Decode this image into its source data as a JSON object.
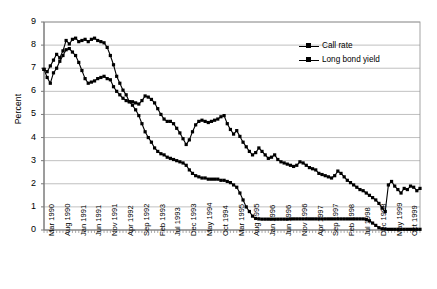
{
  "chart_data": {
    "type": "line",
    "title": "",
    "xlabel": "",
    "ylabel": "Percent",
    "ylim": [
      0,
      9
    ],
    "ytick_values": [
      0,
      1,
      2,
      3,
      4,
      5,
      6,
      7,
      8,
      9
    ],
    "grid": true,
    "legend_position": "top-right",
    "x_tick_labels": [
      "Mar 1990",
      "Aug 1990",
      "Jan 1991",
      "Jun 1991",
      "Nov 1991",
      "Apr 1992",
      "Sep 1992",
      "Feb 1993",
      "Jul 1993",
      "Dec 1993",
      "May 1994",
      "Oct 1994",
      "Mar 1995",
      "Aug 1995",
      "Jan 1996",
      "Jun 1996",
      "Nov 1996",
      "Apr 1997",
      "Sep 1997",
      "Feb 1998",
      "Jul 1998",
      "Dec 1998",
      "May 1999",
      "Oct 1999"
    ],
    "x_tick_interval_months": 5,
    "x_start": "Mar 1990",
    "x_end": "Dec 1999",
    "marker": "square",
    "series": [
      {
        "name": "Call rate",
        "color": "#000000",
        "values": [
          6.95,
          6.85,
          7.1,
          7.35,
          7.6,
          7.45,
          7.75,
          8.2,
          8.05,
          8.25,
          8.3,
          8.15,
          8.2,
          8.25,
          8.15,
          8.25,
          8.3,
          8.2,
          8.15,
          8.1,
          7.9,
          7.55,
          7.15,
          6.65,
          6.35,
          6.05,
          5.85,
          5.55,
          5.4,
          5.2,
          4.95,
          4.6,
          4.25,
          4.0,
          3.8,
          3.55,
          3.4,
          3.3,
          3.25,
          3.15,
          3.1,
          3.05,
          3.0,
          2.95,
          2.9,
          2.8,
          2.6,
          2.45,
          2.35,
          2.3,
          2.25,
          2.25,
          2.2,
          2.2,
          2.2,
          2.2,
          2.15,
          2.15,
          2.1,
          2.05,
          1.95,
          1.85,
          1.6,
          1.3,
          1.0,
          0.8,
          0.6,
          0.5,
          0.48,
          0.47,
          0.47,
          0.47,
          0.47,
          0.47,
          0.47,
          0.47,
          0.47,
          0.47,
          0.48,
          0.48,
          0.48,
          0.48,
          0.48,
          0.48,
          0.48,
          0.48,
          0.48,
          0.48,
          0.48,
          0.48,
          0.48,
          0.48,
          0.48,
          0.48,
          0.48,
          0.48,
          0.48,
          0.48,
          0.48,
          0.48,
          0.48,
          0.48,
          0.45,
          0.4,
          0.3,
          0.2,
          0.1,
          0.05,
          0.04,
          0.03,
          0.03,
          0.03,
          0.03,
          0.03,
          0.03,
          0.03,
          0.03,
          0.03,
          0.03,
          0.03
        ]
      },
      {
        "name": "Long bond yield",
        "color": "#000000",
        "values": [
          6.95,
          6.6,
          6.35,
          6.8,
          7.0,
          7.3,
          7.55,
          7.8,
          7.85,
          7.7,
          7.55,
          7.25,
          6.9,
          6.55,
          6.35,
          6.4,
          6.45,
          6.55,
          6.6,
          6.65,
          6.55,
          6.5,
          6.2,
          6.0,
          5.85,
          5.7,
          5.6,
          5.55,
          5.55,
          5.5,
          5.45,
          5.6,
          5.8,
          5.75,
          5.65,
          5.5,
          5.25,
          5.0,
          4.8,
          4.7,
          4.7,
          4.6,
          4.4,
          4.2,
          3.95,
          3.7,
          3.9,
          4.25,
          4.55,
          4.7,
          4.75,
          4.7,
          4.65,
          4.7,
          4.75,
          4.8,
          4.9,
          4.95,
          4.6,
          4.35,
          4.15,
          4.3,
          4.05,
          3.8,
          3.6,
          3.4,
          3.25,
          3.35,
          3.55,
          3.4,
          3.25,
          3.1,
          3.15,
          3.25,
          3.05,
          2.95,
          2.9,
          2.85,
          2.8,
          2.75,
          2.8,
          2.95,
          2.9,
          2.8,
          2.7,
          2.65,
          2.6,
          2.45,
          2.4,
          2.35,
          2.3,
          2.25,
          2.35,
          2.55,
          2.45,
          2.3,
          2.15,
          2.05,
          1.95,
          1.85,
          1.75,
          1.7,
          1.6,
          1.5,
          1.4,
          1.3,
          1.15,
          0.95,
          0.8,
          1.95,
          2.1,
          1.9,
          1.75,
          1.6,
          1.8,
          1.75,
          1.9,
          1.85,
          1.7,
          1.8
        ]
      }
    ]
  },
  "legend": {
    "items": [
      {
        "label": "Call rate"
      },
      {
        "label": "Long bond yield"
      }
    ]
  },
  "axes": {
    "y_label": "Percent"
  }
}
